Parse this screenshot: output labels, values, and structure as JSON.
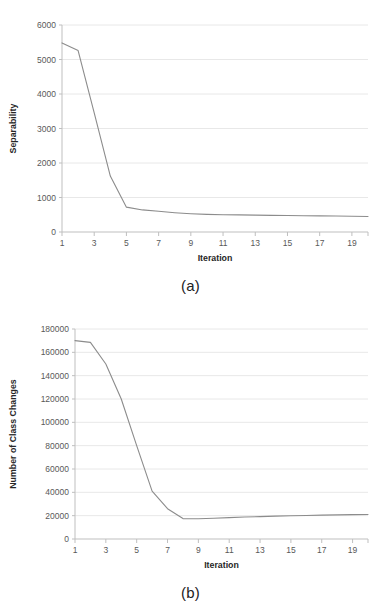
{
  "figure": {
    "background_color": "#ffffff",
    "line_color": "#8c8c8c",
    "gridline_color": "#e8e8e8",
    "axis_color": "#bfbfbf",
    "text_color": "#404040",
    "panels": [
      {
        "caption": "(a)"
      },
      {
        "caption": "(b)"
      }
    ]
  },
  "chart_data": [
    {
      "type": "line",
      "panel": "(a)",
      "title": "",
      "xlabel": "Iteration",
      "ylabel": "Separability",
      "x": [
        1,
        2,
        3,
        4,
        5,
        6,
        7,
        8,
        9,
        10,
        11,
        12,
        13,
        14,
        15,
        16,
        17,
        18,
        19,
        20
      ],
      "values": [
        5480,
        5260,
        3450,
        1620,
        720,
        640,
        600,
        560,
        530,
        510,
        500,
        495,
        490,
        483,
        478,
        472,
        468,
        462,
        455,
        450
      ],
      "series": [
        {
          "name": "Separability",
          "values": [
            5480,
            5260,
            3450,
            1620,
            720,
            640,
            600,
            560,
            530,
            510,
            500,
            495,
            490,
            483,
            478,
            472,
            468,
            462,
            455,
            450
          ]
        }
      ],
      "xlim": [
        1,
        20
      ],
      "ylim": [
        0,
        6000
      ],
      "ytick_values": [
        0,
        1000,
        2000,
        3000,
        4000,
        5000,
        6000
      ],
      "ytick_labels": [
        "0",
        "1000",
        "2000",
        "3000",
        "4000",
        "5000",
        "6000"
      ],
      "xtick_values": [
        1,
        3,
        5,
        7,
        9,
        11,
        13,
        15,
        17,
        19
      ],
      "xtick_labels": [
        "1",
        "3",
        "5",
        "7",
        "9",
        "11",
        "13",
        "15",
        "17",
        "19"
      ],
      "grid": true,
      "grid_axis": "y",
      "legend": false,
      "legend_position": "none",
      "markers": false
    },
    {
      "type": "line",
      "panel": "(b)",
      "title": "",
      "xlabel": "Iteration",
      "ylabel": "Number of Class Changes",
      "x": [
        1,
        2,
        3,
        4,
        5,
        6,
        7,
        8,
        9,
        10,
        11,
        12,
        13,
        14,
        15,
        16,
        17,
        18,
        19,
        20
      ],
      "values": [
        170000,
        168500,
        150000,
        120000,
        80000,
        41000,
        26000,
        17500,
        17400,
        17800,
        18300,
        18800,
        19200,
        19600,
        19900,
        20200,
        20500,
        20700,
        20900,
        21000
      ],
      "series": [
        {
          "name": "Number of Class Changes",
          "values": [
            170000,
            168500,
            150000,
            120000,
            80000,
            41000,
            26000,
            17500,
            17400,
            17800,
            18300,
            18800,
            19200,
            19600,
            19900,
            20200,
            20500,
            20700,
            20900,
            21000
          ]
        }
      ],
      "xlim": [
        1,
        20
      ],
      "ylim": [
        0,
        180000
      ],
      "ytick_values": [
        0,
        20000,
        40000,
        60000,
        80000,
        100000,
        120000,
        140000,
        160000,
        180000
      ],
      "ytick_labels": [
        "0",
        "20000",
        "40000",
        "60000",
        "80000",
        "100000",
        "120000",
        "140000",
        "160000",
        "180000"
      ],
      "xtick_values": [
        1,
        3,
        5,
        7,
        9,
        11,
        13,
        15,
        17,
        19
      ],
      "xtick_labels": [
        "1",
        "3",
        "5",
        "7",
        "9",
        "11",
        "13",
        "15",
        "17",
        "19"
      ],
      "grid": true,
      "grid_axis": "y",
      "legend": false,
      "legend_position": "none",
      "markers": false
    }
  ]
}
